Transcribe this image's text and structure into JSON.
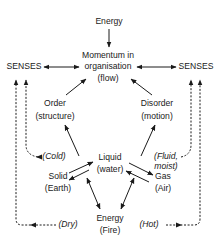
{
  "diagram": {
    "top_energy": "Energy",
    "momentum": {
      "line1": "Momentum in",
      "line2": "organisation",
      "line3": "(flow)"
    },
    "senses_left": "SENSES",
    "senses_right": "SENSES",
    "order": {
      "line1": "Order",
      "line2": "(structure)"
    },
    "disorder": {
      "line1": "Disorder",
      "line2": "(motion)"
    },
    "liquid": {
      "line1": "Liquid",
      "line2": "(water)"
    },
    "solid": {
      "line1": "Solid",
      "line2": "(Earth)"
    },
    "gas": {
      "line1": "Gas",
      "line2": "(Air)"
    },
    "energy_fire": {
      "line1": "Energy",
      "line2": "(Fire)"
    },
    "qualities": {
      "cold": "(Cold)",
      "fluid_line1": "(Fluid,",
      "fluid_line2": "moist)",
      "dry": "(Dry)",
      "hot": "(Hot)"
    },
    "colors": {
      "ink": "#1a1a1a",
      "background": "#ffffff"
    }
  }
}
